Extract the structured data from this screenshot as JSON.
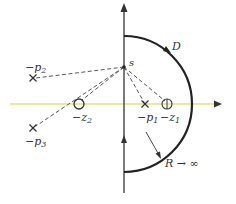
{
  "diagram": {
    "colors": {
      "real_axis": "#e6e07a",
      "lines": "#333333",
      "contour": "#222222"
    },
    "labels": {
      "s": "s",
      "contour": "D",
      "radius": "R → ∞",
      "p1": "−p",
      "p1_sub": "1",
      "p2": "−p",
      "p2_sub": "2",
      "p3": "−p",
      "p3_sub": "3",
      "z1": "−z",
      "z1_sub": "1",
      "z2": "−z",
      "z2_sub": "2"
    },
    "poles": [
      {
        "name": "-p1",
        "x": 145,
        "y": 104
      },
      {
        "name": "-p2",
        "x": 33,
        "y": 78
      },
      {
        "name": "-p3",
        "x": 33,
        "y": 128
      }
    ],
    "zeros": [
      {
        "name": "-z1",
        "x": 167,
        "y": 104
      },
      {
        "name": "-z2",
        "x": 79,
        "y": 104
      }
    ],
    "point_s": {
      "x": 124,
      "y": 67
    }
  }
}
